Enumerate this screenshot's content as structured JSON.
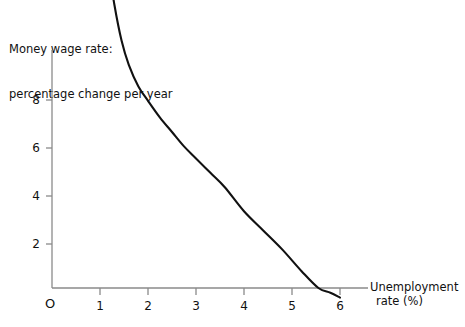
{
  "figure": {
    "title_lines": [
      "Money wage rate:",
      "percentage change per year"
    ],
    "x_axis_label_lines": [
      "Unemployment",
      "rate (%)"
    ],
    "origin_label": "O",
    "axis_color": "#8a8a8a",
    "curve_color": "#111111",
    "background": "#ffffff"
  },
  "chart_data": {
    "type": "line",
    "title": "Money wage rate: percentage change per year",
    "xlabel": "Unemployment rate (%)",
    "ylabel": "Money wage rate: percentage change per year",
    "xlim": [
      0,
      6.5
    ],
    "ylim": [
      -0.3,
      9.6
    ],
    "grid": false,
    "legend": null,
    "xticks": [
      1,
      2,
      3,
      4,
      5,
      6
    ],
    "xtick_labels": [
      "1",
      "2",
      "3",
      "4",
      "5",
      "6"
    ],
    "yticks": [
      2,
      4,
      6,
      8
    ],
    "ytick_labels": [
      "2",
      "4",
      "6",
      "8"
    ],
    "series": [
      {
        "name": "Phillips curve",
        "x": [
          1.0,
          1.05,
          1.1,
          1.2,
          1.3,
          1.45,
          1.6,
          1.8,
          2.0,
          2.25,
          2.5,
          2.75,
          3.0,
          3.3,
          3.6,
          4.0,
          4.4,
          4.8,
          5.2,
          5.55,
          5.8,
          6.0
        ],
        "y": [
          9.0,
          8.3,
          7.6,
          6.6,
          5.9,
          5.15,
          4.65,
          4.2,
          3.9,
          3.55,
          3.25,
          2.95,
          2.7,
          2.4,
          2.1,
          1.6,
          1.2,
          0.8,
          0.35,
          0.0,
          -0.1,
          -0.2
        ]
      }
    ]
  }
}
